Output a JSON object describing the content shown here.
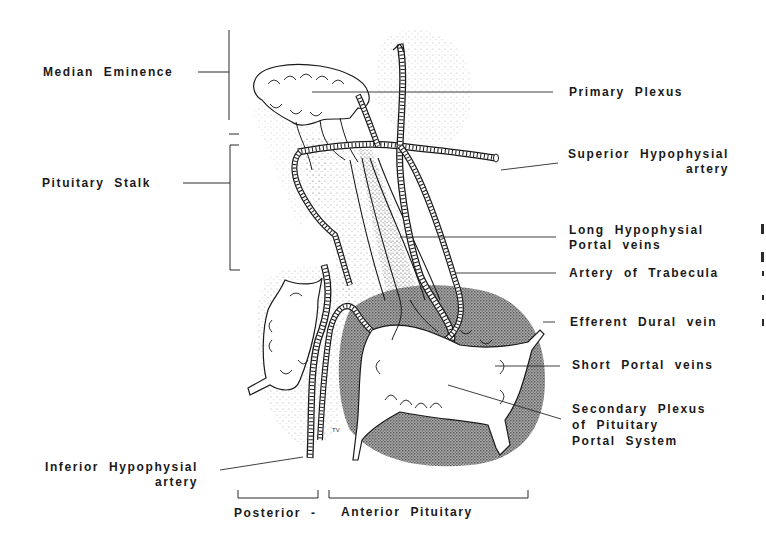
{
  "diagram": {
    "colors": {
      "ink": "#1a1a1a",
      "stipple": "#555555",
      "background": "#ffffff"
    },
    "labels": {
      "median_eminence": "Median Eminence",
      "pituitary_stalk": "Pituitary Stalk",
      "primary_plexus": "Primary Plexus",
      "superior_hypophysial_artery": [
        "Superior Hypophysial",
        "artery"
      ],
      "long_hypophysial_portal_veins": [
        "Long Hypophysial",
        "Portal veins"
      ],
      "artery_of_trabecula": "Artery of Trabecula",
      "efferent_dural_vein": "Efferent Dural vein",
      "short_portal_veins": "Short Portal veins",
      "secondary_plexus": [
        "Secondary Plexus",
        "of Pituitary",
        "Portal System"
      ],
      "inferior_hypophysial_artery": [
        "Inferior Hypophysial",
        "artery"
      ],
      "posterior": "Posterior -",
      "anterior_pituitary": "Anterior Pituitary",
      "artist_mark": "TV"
    }
  }
}
